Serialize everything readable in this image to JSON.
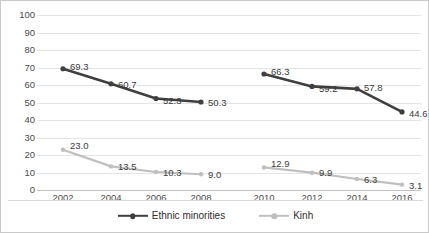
{
  "chart_data": {
    "type": "line",
    "title": "",
    "xlabel": "",
    "ylabel": "",
    "ylim": [
      0,
      100
    ],
    "yticks": [
      0,
      10,
      20,
      30,
      40,
      50,
      60,
      70,
      80,
      90,
      100
    ],
    "grid": true,
    "legend_position": "bottom",
    "x": [
      "2002",
      "2004",
      "2006",
      "2008",
      "2010",
      "2012",
      "2014",
      "2016"
    ],
    "panels": [
      {
        "name": "left-panel",
        "x": [
          "2002",
          "2004",
          "2006",
          "2008"
        ]
      },
      {
        "name": "right-panel",
        "x": [
          "2010",
          "2012",
          "2014",
          "2016"
        ]
      }
    ],
    "series": [
      {
        "name": "Ethnic minorities",
        "color": "#3f3f3f",
        "values": [
          69.3,
          60.7,
          52.3,
          50.3,
          66.3,
          59.2,
          57.8,
          44.6
        ],
        "labels": [
          "69.3",
          "60.7",
          "52.3",
          "50.3",
          "66.3",
          "59.2",
          "57.8",
          "44.6"
        ]
      },
      {
        "name": "Kinh",
        "color": "#bfbfbf",
        "values": [
          23.0,
          13.5,
          10.3,
          9.0,
          12.9,
          9.9,
          6.3,
          3.1
        ],
        "labels": [
          "23.0",
          "13.5",
          "10.3",
          "9.0",
          "12.9",
          "9.9",
          "6.3",
          "3.1"
        ]
      }
    ]
  },
  "legend": {
    "items": [
      {
        "label": "Ethnic minorities",
        "color": "#3f3f3f",
        "marker": "circle"
      },
      {
        "label": "Kinh",
        "color": "#bfbfbf",
        "marker": "circle"
      }
    ]
  },
  "colors": {
    "ethnic_minorities": "#3f3f3f",
    "kinh": "#bfbfbf",
    "gridline": "#e4e4e4",
    "axis": "#c2c2c2",
    "border": "#c9c9c9",
    "tick_text": "#4b4b4b",
    "label_text": "#3a3a3a"
  }
}
